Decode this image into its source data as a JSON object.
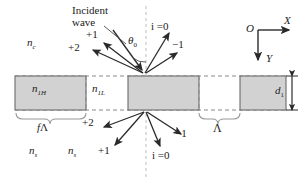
{
  "figure": {
    "colors": {
      "grating_fill": "#d2d2d2",
      "grating_stroke": "#6e6e6e",
      "line": "#2a2a2a",
      "dashed": "#7a7a7a",
      "axis_dash": "#b9b9b9",
      "text": "#1b1b1b"
    }
  },
  "annotations": {
    "incident_wave": "Incident\nwave",
    "incident_wave_line1": "Incident",
    "incident_wave_line2": "wave",
    "incidence_angle": "θ",
    "incidence_angle_sub": "0",
    "cover_index": "n",
    "cover_index_sub": "c",
    "high_index": "n",
    "high_index_sub": "1H",
    "low_index": "n",
    "low_index_sub": "1L",
    "substrate_index_left": "n",
    "substrate_index_left_sub": "s",
    "substrate_index_right": "n",
    "substrate_index_right_sub": "s",
    "fill_factor": "fΛ",
    "fill_factor_f": "f",
    "fill_factor_lambda": "Λ",
    "period": "Λ",
    "depth": "d",
    "depth_sub": "1"
  },
  "orders": {
    "reflected": [
      {
        "label": "+2",
        "x": 74,
        "y": 47
      },
      {
        "label": "+1",
        "x": 91,
        "y": 36
      },
      {
        "label": "−1",
        "x": 173,
        "y": 42
      },
      {
        "label": "i =0",
        "x": 152,
        "y": 22
      }
    ],
    "transmitted": [
      {
        "label": "+2",
        "x": 86,
        "y": 119
      },
      {
        "label": "+1",
        "x": 100,
        "y": 148
      },
      {
        "label": "−1",
        "x": 176,
        "y": 131
      },
      {
        "label": "i =0",
        "x": 155,
        "y": 152
      }
    ]
  },
  "axes": {
    "origin": "O",
    "x_label": "X",
    "y_label": "Y"
  }
}
